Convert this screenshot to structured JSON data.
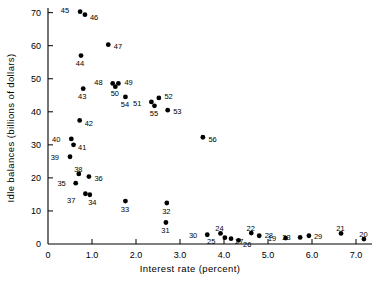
{
  "chart_data": {
    "type": "scatter",
    "title": "",
    "xlabel": "Interest rate (percent)",
    "ylabel": "Idle balances (billions of dollars)",
    "xlim": [
      0,
      7.5
    ],
    "ylim": [
      0,
      73
    ],
    "grid": false,
    "legend": "none",
    "xticks": [
      {
        "value": 0,
        "label": "0"
      },
      {
        "value": 1,
        "label": "1.0"
      },
      {
        "value": 2,
        "label": "2.0"
      },
      {
        "value": 3,
        "label": "3.0"
      },
      {
        "value": 4,
        "label": "4.0"
      },
      {
        "value": 5,
        "label": "5.0"
      },
      {
        "value": 6,
        "label": "6.0"
      },
      {
        "value": 7,
        "label": "7.0"
      }
    ],
    "yticks": [
      {
        "value": 0,
        "label": "0"
      },
      {
        "value": 10,
        "label": "10"
      },
      {
        "value": 20,
        "label": "20"
      },
      {
        "value": 30,
        "label": "30"
      },
      {
        "value": 40,
        "label": "40"
      },
      {
        "value": 50,
        "label": "50"
      },
      {
        "value": 60,
        "label": "60"
      },
      {
        "value": 70,
        "label": "70"
      }
    ],
    "point_labels_are": "year (two-digit)",
    "points": [
      {
        "label": "45",
        "x": 0.73,
        "y": 70.3,
        "lx": -11,
        "ly": -1.5
      },
      {
        "label": "46",
        "x": 0.84,
        "y": 69.4,
        "lx": 5,
        "ly": 2.5
      },
      {
        "label": "47",
        "x": 1.37,
        "y": 60.3,
        "lx": 5.5,
        "ly": 1.5
      },
      {
        "label": "44",
        "x": 0.75,
        "y": 57.0,
        "lx": -1,
        "ly": 7.5
      },
      {
        "label": "48",
        "x": 1.47,
        "y": 48.6,
        "lx": -10,
        "ly": -1
      },
      {
        "label": "49",
        "x": 1.6,
        "y": 48.6,
        "lx": 6,
        "ly": -1
      },
      {
        "label": "50",
        "x": 1.53,
        "y": 47.6,
        "lx": -0.5,
        "ly": 7
      },
      {
        "label": "43",
        "x": 0.8,
        "y": 47.0,
        "lx": -1,
        "ly": 7.5
      },
      {
        "label": "54",
        "x": 1.76,
        "y": 44.5,
        "lx": -0.5,
        "ly": 7.5
      },
      {
        "label": "52",
        "x": 2.52,
        "y": 44.2,
        "lx": 5.5,
        "ly": -1
      },
      {
        "label": "51",
        "x": 2.35,
        "y": 43.0,
        "lx": -10,
        "ly": 1.5
      },
      {
        "label": "55",
        "x": 2.42,
        "y": 41.8,
        "lx": -0.5,
        "ly": 7.5
      },
      {
        "label": "53",
        "x": 2.72,
        "y": 40.5,
        "lx": 5.5,
        "ly": 1.5
      },
      {
        "label": "42",
        "x": 0.72,
        "y": 37.4,
        "lx": 5,
        "ly": 3
      },
      {
        "label": "56",
        "x": 3.52,
        "y": 32.3,
        "lx": 5.5,
        "ly": 2.5
      },
      {
        "label": "40",
        "x": 0.53,
        "y": 31.8,
        "lx": -11,
        "ly": 0.5
      },
      {
        "label": "41",
        "x": 0.58,
        "y": 30.0,
        "lx": 4.5,
        "ly": 2.5
      },
      {
        "label": "39",
        "x": 0.5,
        "y": 26.4,
        "lx": -11,
        "ly": 1
      },
      {
        "label": "38",
        "x": 0.7,
        "y": 21.2,
        "lx": -0.5,
        "ly": -4.5
      },
      {
        "label": "36",
        "x": 0.93,
        "y": 20.4,
        "lx": 5.5,
        "ly": 1.5
      },
      {
        "label": "35",
        "x": 0.63,
        "y": 18.4,
        "lx": -10,
        "ly": 0.5
      },
      {
        "label": "37",
        "x": 0.85,
        "y": 15.2,
        "lx": -10,
        "ly": 6.5
      },
      {
        "label": "34",
        "x": 0.95,
        "y": 14.9,
        "lx": 2.5,
        "ly": 7.5
      },
      {
        "label": "33",
        "x": 1.76,
        "y": 13.0,
        "lx": -0.5,
        "ly": 8
      },
      {
        "label": "32",
        "x": 2.7,
        "y": 12.4,
        "lx": -0.5,
        "ly": 8
      },
      {
        "label": "31",
        "x": 2.68,
        "y": 6.5,
        "lx": -0.5,
        "ly": 8
      },
      {
        "label": "30",
        "x": 3.62,
        "y": 2.8,
        "lx": -10,
        "ly": 1
      },
      {
        "label": "24",
        "x": 3.92,
        "y": 3.2,
        "lx": -1,
        "ly": -4.5
      },
      {
        "label": "25",
        "x": 4.02,
        "y": 1.9,
        "lx": -9.5,
        "ly": 4
      },
      {
        "label": "27",
        "x": 4.16,
        "y": 1.6,
        "lx": 4,
        "ly": 3
      },
      {
        "label": "26",
        "x": 4.33,
        "y": 1.1,
        "lx": 4.5,
        "ly": 4
      },
      {
        "label": "22",
        "x": 4.62,
        "y": 3.3,
        "lx": -0.5,
        "ly": -4.5
      },
      {
        "label": "28",
        "x": 4.8,
        "y": 2.5,
        "lx": 5.5,
        "ly": -0.5
      },
      {
        "label": "19",
        "x": 5.4,
        "y": 1.8,
        "lx": -9.5,
        "ly": 0.5
      },
      {
        "label": "23",
        "x": 5.73,
        "y": 2.0,
        "lx": -9.5,
        "ly": 0.5
      },
      {
        "label": "29",
        "x": 5.93,
        "y": 2.5,
        "lx": 5,
        "ly": 0.5
      },
      {
        "label": "21",
        "x": 6.66,
        "y": 3.2,
        "lx": -0.5,
        "ly": -4.5
      },
      {
        "label": "20",
        "x": 7.18,
        "y": 1.5,
        "lx": -0.5,
        "ly": -4.5
      }
    ]
  }
}
